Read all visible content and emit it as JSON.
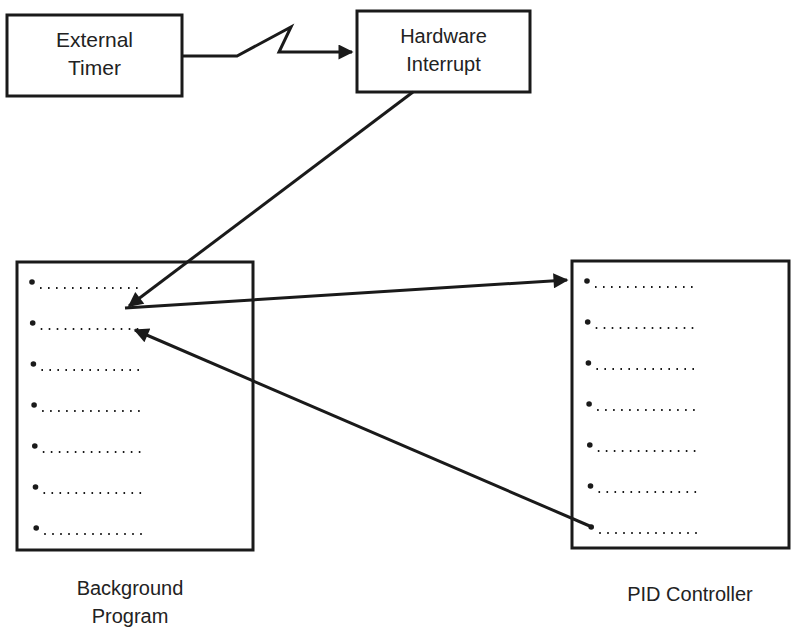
{
  "diagram": {
    "nodes": {
      "external_timer": {
        "line1": "External",
        "line2": "Timer"
      },
      "hardware_interrupt": {
        "line1": "Hardware",
        "line2": "Interrupt"
      },
      "background_program": {
        "caption_line1": "Background",
        "caption_line2": "Program",
        "list_items": 7
      },
      "pid_controller": {
        "caption": "PID Controller",
        "list_items": 7
      }
    },
    "edges": [
      {
        "from": "External Timer",
        "to": "Hardware Interrupt",
        "style": "lightning"
      },
      {
        "from": "Hardware Interrupt",
        "to": "Background Program (line 1)",
        "style": "arrow"
      },
      {
        "from": "Background Program (line 1)",
        "to": "PID Controller (line 1)",
        "style": "arrow"
      },
      {
        "from": "PID Controller (line 7)",
        "to": "Background Program (line 2)",
        "style": "arrow"
      }
    ],
    "colors": {
      "ink": "#1a1a1a",
      "background": "#ffffff"
    }
  }
}
